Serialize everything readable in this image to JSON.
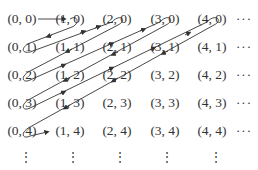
{
  "diagram": {
    "rows": [
      [
        "(0, 0)",
        "(1, 0)",
        "(2, 0)",
        "(3, 0)",
        "(4, 0)"
      ],
      [
        "(0, 1)",
        "(1, 1)",
        "(2, 1)",
        "(3, 1)",
        "(4, 1)"
      ],
      [
        "(0, 2)",
        "(1, 2)",
        "(2, 2)",
        "(3, 2)",
        "(4, 2)"
      ],
      [
        "(0, 3)",
        "(1, 3)",
        "(2, 3)",
        "(3, 3)",
        "(4, 3)"
      ],
      [
        "(0, 4)",
        "(1, 4)",
        "(2, 4)",
        "(3, 4)",
        "(4, 4)"
      ]
    ],
    "row_continuation": "···",
    "column_continuation": "⋮",
    "colors": {
      "text": "#333333",
      "arrow": "#333333",
      "background": "#ffffff"
    }
  }
}
